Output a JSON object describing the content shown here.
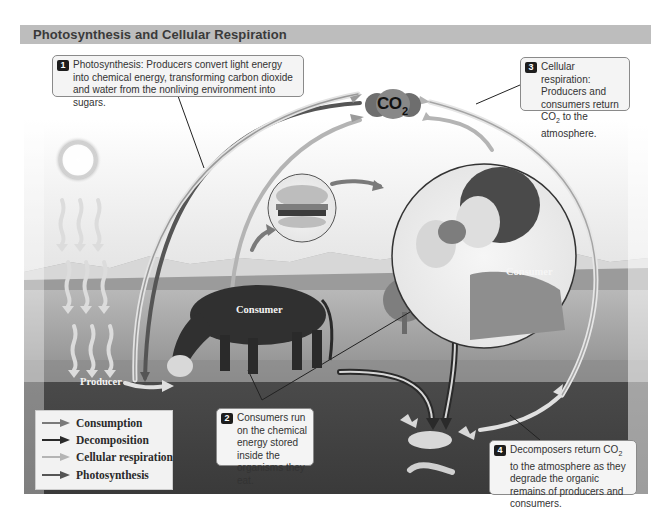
{
  "header": {
    "title": "Photosynthesis and Cellular Respiration"
  },
  "callouts": [
    {
      "number": "1",
      "text": "Photosynthesis: Producers convert light energy into chemical energy, transforming carbon dioxide and water from the nonliving environment into sugars."
    },
    {
      "number": "2",
      "text": "Consumers run on the chemical energy stored inside the organisms they eat."
    },
    {
      "number": "3",
      "text_before": "Cellular respiration: Producers and consumers return CO",
      "sub": "2",
      "text_after": " to the atmosphere."
    },
    {
      "number": "4",
      "text_before": "Decomposers return CO",
      "sub": "2",
      "text_after": " to the atmosphere as they degrade the organic remains of producers and consumers."
    }
  ],
  "molecule": {
    "label": "CO",
    "subscript": "2"
  },
  "scene_labels": {
    "producer": "Producer",
    "consumer_cow": "Consumer",
    "consumer_person": "Consumer"
  },
  "legend": {
    "items": [
      {
        "label": "Consumption",
        "color": "#7a7a7a"
      },
      {
        "label": "Decomposition",
        "color": "#2a2a2a"
      },
      {
        "label": "Cellular respiration",
        "color": "#b4b4b4"
      },
      {
        "label": "Photosynthesis",
        "color": "#555555"
      }
    ]
  },
  "colors": {
    "title_bar": "#bdbdbd",
    "ground": "#3b3b3b",
    "sky": "#f2f2f2",
    "callout_bg": "#f4f4f4"
  }
}
